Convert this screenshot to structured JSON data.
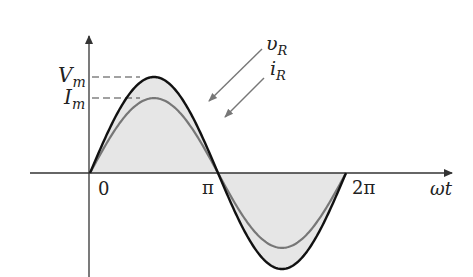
{
  "figure": {
    "type": "waveform-diagram"
  },
  "axes": {
    "x_label": "ωt",
    "ticks": [
      {
        "label": "0",
        "value": 0
      },
      {
        "label": "π",
        "value": 3.14159
      },
      {
        "label": "2π",
        "value": 6.28318
      }
    ]
  },
  "levels": {
    "vm": {
      "main": "V",
      "sub": "m"
    },
    "im": {
      "main": "I",
      "sub": "m"
    }
  },
  "curves": {
    "voltage": {
      "main": "υ",
      "sub": "R",
      "amplitude": 1.0,
      "color": "#111111"
    },
    "current": {
      "main": "i",
      "sub": "R",
      "amplitude": 0.78,
      "color": "#777777"
    }
  },
  "colors": {
    "fill": "#e6e6e6",
    "axis": "#333333"
  }
}
